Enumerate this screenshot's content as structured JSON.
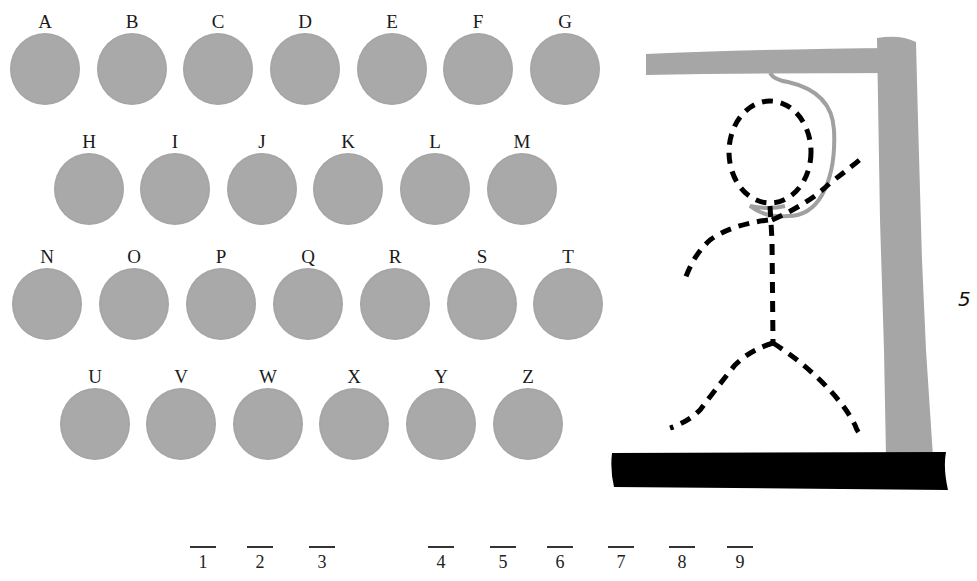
{
  "game": {
    "title": "Hangman",
    "wrong_guesses": "5",
    "letters": [
      {
        "label": "A"
      },
      {
        "label": "B"
      },
      {
        "label": "C"
      },
      {
        "label": "D"
      },
      {
        "label": "E"
      },
      {
        "label": "F"
      },
      {
        "label": "G"
      },
      {
        "label": "H"
      },
      {
        "label": "I"
      },
      {
        "label": "J"
      },
      {
        "label": "K"
      },
      {
        "label": "L"
      },
      {
        "label": "M"
      },
      {
        "label": "N"
      },
      {
        "label": "O"
      },
      {
        "label": "P"
      },
      {
        "label": "Q"
      },
      {
        "label": "R"
      },
      {
        "label": "S"
      },
      {
        "label": "T"
      },
      {
        "label": "U"
      },
      {
        "label": "V"
      },
      {
        "label": "W"
      },
      {
        "label": "X"
      },
      {
        "label": "Y"
      },
      {
        "label": "Z"
      }
    ],
    "word_slots": [
      {
        "index": "1",
        "value": ""
      },
      {
        "index": "2",
        "value": ""
      },
      {
        "index": "3",
        "value": ""
      },
      {
        "index": "4",
        "value": ""
      },
      {
        "index": "5",
        "value": ""
      },
      {
        "index": "6",
        "value": ""
      },
      {
        "index": "7",
        "value": ""
      },
      {
        "index": "8",
        "value": ""
      },
      {
        "index": "9",
        "value": ""
      }
    ],
    "colors": {
      "disc": "#a9a9a9",
      "gallows_wood": "#a6a6a6",
      "base": "#000000",
      "figure": "#000000",
      "rope": "#a0a0a0"
    }
  }
}
